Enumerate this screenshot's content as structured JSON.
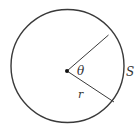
{
  "diagram": {
    "type": "circle-sector",
    "colors": {
      "stroke": "#3a3a3a",
      "background": "#ffffff",
      "text": "#333333"
    },
    "labels": {
      "angle": "θ",
      "radius": "r",
      "arc": "S"
    }
  }
}
